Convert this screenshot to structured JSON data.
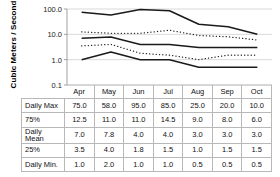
{
  "chart_data": {
    "type": "line",
    "title": "",
    "xlabel": "",
    "ylabel": "Cubic Meters / Second",
    "yscale": "log",
    "ylim": [
      0.1,
      100.0
    ],
    "ytick_labels": [
      "100.0",
      "10.0",
      "1.0",
      "0.1"
    ],
    "ytick_values": [
      100.0,
      10.0,
      1.0,
      0.1
    ],
    "grid": "horizontal",
    "legend": "none",
    "categories": [
      "Apr",
      "May",
      "Jun",
      "Jul",
      "Aug",
      "Sep",
      "Oct"
    ],
    "series": [
      {
        "name": "Daily Max",
        "style": "solid",
        "values": [
          75.0,
          58.0,
          95.0,
          85.0,
          25.0,
          20.0,
          10.0
        ]
      },
      {
        "name": "75%",
        "style": "dotted",
        "values": [
          12.5,
          11.0,
          11.0,
          14.5,
          9.0,
          8.0,
          6.0
        ]
      },
      {
        "name": "Daily Mean",
        "style": "solid",
        "values": [
          7.0,
          7.8,
          4.0,
          4.0,
          3.0,
          3.0,
          3.0
        ]
      },
      {
        "name": "25%",
        "style": "dotted",
        "values": [
          3.5,
          4.0,
          1.8,
          1.5,
          1.0,
          1.5,
          1.5
        ]
      },
      {
        "name": "Daily Min.",
        "style": "solid",
        "values": [
          1.0,
          2.0,
          1.0,
          1.0,
          0.5,
          0.5,
          0.5
        ]
      }
    ]
  },
  "table": {
    "header": [
      "",
      "Apr",
      "May",
      "Jun",
      "Jul",
      "Aug",
      "Sep",
      "Oct"
    ],
    "rows": [
      {
        "label": "Daily Max",
        "cells": [
          "75.0",
          "58.0",
          "95.0",
          "85.0",
          "25.0",
          "20.0",
          "10.0"
        ]
      },
      {
        "label": "75%",
        "cells": [
          "12.5",
          "11.0",
          "11.0",
          "14.5",
          "9.0",
          "8.0",
          "6.0"
        ]
      },
      {
        "label": "Daily Mean",
        "cells": [
          "7.0",
          "7.8",
          "4.0",
          "4.0",
          "3.0",
          "3.0",
          "3.0"
        ]
      },
      {
        "label": "25%",
        "cells": [
          "3.5",
          "4.0",
          "1.8",
          "1.5",
          "1.0",
          "1.5",
          "1.5"
        ]
      },
      {
        "label": "Daily Min.",
        "cells": [
          "1.0",
          "2.0",
          "1.0",
          "1.0",
          "0.5",
          "0.5",
          "0.5"
        ]
      }
    ]
  },
  "colors": {
    "line": "#1a1a1a",
    "grid": "#c9c9c9",
    "axis": "#8a8a8a",
    "table_border": "#b8b8b8"
  }
}
